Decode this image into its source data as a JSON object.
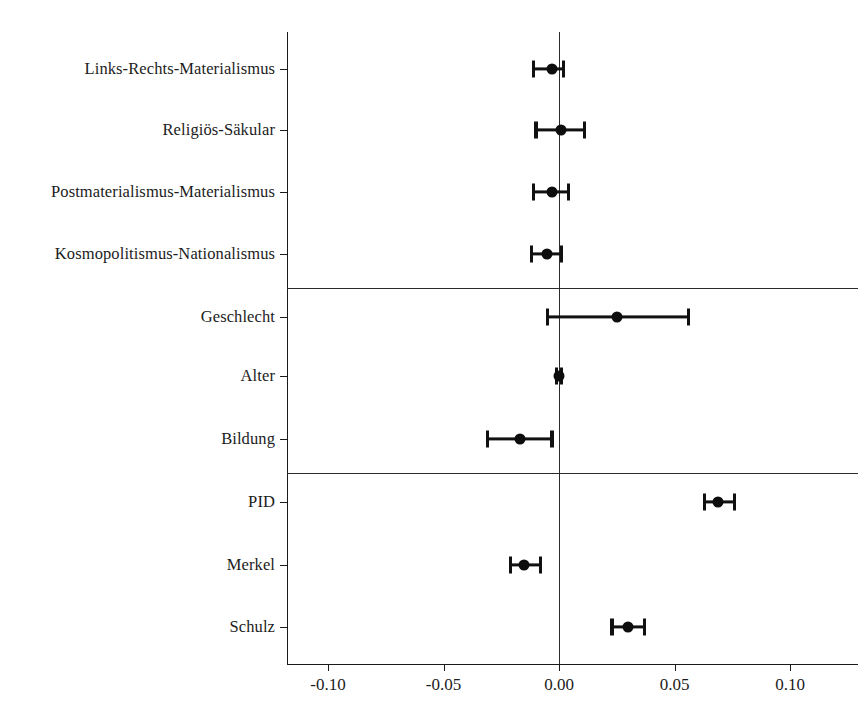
{
  "chart_data": {
    "type": "scatter",
    "subtype": "coefficient-plot",
    "title": "",
    "xlabel": "",
    "ylabel": "",
    "xlim": [
      -0.125,
      0.125
    ],
    "xticks": [
      -0.1,
      -0.05,
      0.0,
      0.05,
      0.1
    ],
    "xticklabels": [
      "-0.10",
      "-0.05",
      "0.00",
      "0.05",
      "0.10"
    ],
    "grid": false,
    "legend": false,
    "zero_reference_line": 0.0,
    "panel_separators_after": [
      "Kosmopolitismus-Nationalismus",
      "Bildung"
    ],
    "categories": [
      "Links-Rechts-Materialismus",
      "Religiös-Säkular",
      "Postmaterialismus-Materialismus",
      "Kosmopolitismus-Nationalismus",
      "Geschlecht",
      "Alter",
      "Bildung",
      "PID",
      "Merkel",
      "Schulz"
    ],
    "points": [
      {
        "label": "Links-Rechts-Materialismus",
        "estimate": -0.003,
        "ci_low": -0.011,
        "ci_high": 0.002
      },
      {
        "label": "Religiös-Säkular",
        "estimate": 0.001,
        "ci_low": -0.01,
        "ci_high": 0.011
      },
      {
        "label": "Postmaterialismus-Materialismus",
        "estimate": -0.003,
        "ci_low": -0.011,
        "ci_high": 0.004
      },
      {
        "label": "Kosmopolitismus-Nationalismus",
        "estimate": -0.005,
        "ci_low": -0.012,
        "ci_high": 0.001
      },
      {
        "label": "Geschlecht",
        "estimate": 0.025,
        "ci_low": -0.005,
        "ci_high": 0.056
      },
      {
        "label": "Alter",
        "estimate": 0.0,
        "ci_low": -0.001,
        "ci_high": 0.001
      },
      {
        "label": "Bildung",
        "estimate": -0.017,
        "ci_low": -0.031,
        "ci_high": -0.003
      },
      {
        "label": "PID",
        "estimate": 0.069,
        "ci_low": 0.063,
        "ci_high": 0.076
      },
      {
        "label": "Merkel",
        "estimate": -0.015,
        "ci_low": -0.021,
        "ci_high": -0.008
      },
      {
        "label": "Schulz",
        "estimate": 0.03,
        "ci_low": 0.023,
        "ci_high": 0.037
      }
    ],
    "colors": {
      "point": "#0d0d0d",
      "ci": "#111111",
      "axis": "#1a1a1a",
      "zero_line": "#2b2b2b",
      "background": "#ffffff"
    }
  }
}
